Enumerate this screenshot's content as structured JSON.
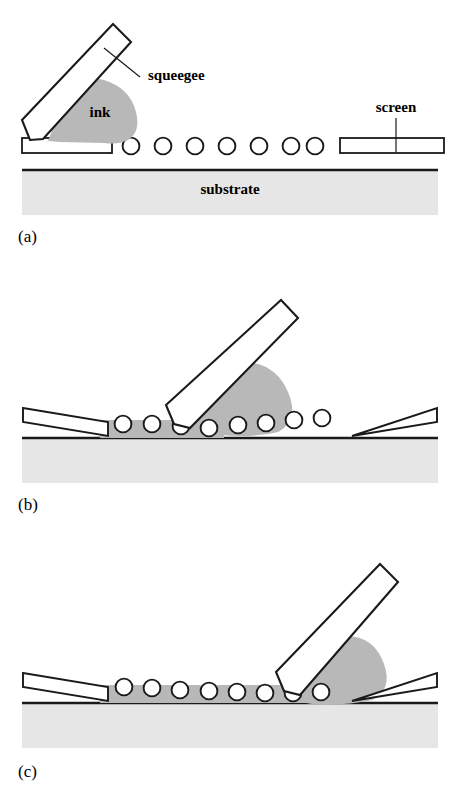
{
  "figure": {
    "background_color": "#ffffff",
    "line_color": "#1a1a1a",
    "ink_color": "#b8b8b8",
    "substrate_color": "#e6e6e6",
    "screen_fill_color": "#ffffff"
  },
  "labels": {
    "squeegee": "squeegee",
    "ink": "ink",
    "screen": "screen",
    "substrate": "substrate"
  },
  "panels": [
    {
      "id": "a",
      "caption": "(a)",
      "stage_description": "Squeegee at left, ink reservoir loaded, screen flat above substrate",
      "circle_count": 8,
      "squeegee_tip_circle_index": 0,
      "ink_spread": "none",
      "screen_state": "flat",
      "visible_labels": [
        "squeegee",
        "ink",
        "screen",
        "substrate"
      ]
    },
    {
      "id": "b",
      "caption": "(b)",
      "stage_description": "Squeegee moved to middle, screen deflected, ink deposited behind squeegee",
      "circle_count": 8,
      "squeegee_tip_circle_index": 3,
      "ink_spread": "partial",
      "screen_state": "deflected",
      "visible_labels": []
    },
    {
      "id": "c",
      "caption": "(c)",
      "stage_description": "Squeegee near right end, most of pattern printed with ink",
      "circle_count": 8,
      "squeegee_tip_circle_index": 7,
      "ink_spread": "near-complete",
      "screen_state": "deflected",
      "visible_labels": []
    }
  ]
}
